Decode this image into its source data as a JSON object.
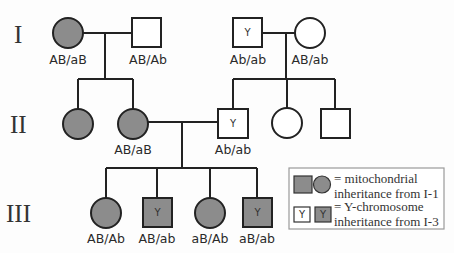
{
  "colors": {
    "affected_fill": "#8c8c8c",
    "unaffected_fill": "#ffffff",
    "stroke": "#222222",
    "legend_border": "#9a9a9a"
  },
  "generations": [
    {
      "label": "I"
    },
    {
      "label": "II"
    },
    {
      "label": "III"
    }
  ],
  "individuals": {
    "I_1": {
      "sex": "female",
      "shaded": true,
      "y_marker": false,
      "genotype": "AB/aB"
    },
    "I_2": {
      "sex": "male",
      "shaded": false,
      "y_marker": false,
      "genotype": "AB/Ab"
    },
    "I_3": {
      "sex": "male",
      "shaded": false,
      "y_marker": true,
      "y_text": "Y",
      "genotype": "Ab/ab"
    },
    "I_4": {
      "sex": "female",
      "shaded": false,
      "y_marker": false,
      "genotype": "AB/ab"
    },
    "II_1": {
      "sex": "female",
      "shaded": true,
      "y_marker": false,
      "genotype": ""
    },
    "II_2": {
      "sex": "female",
      "shaded": true,
      "y_marker": false,
      "genotype": "AB/aB"
    },
    "II_3": {
      "sex": "male",
      "shaded": false,
      "y_marker": true,
      "y_text": "Y",
      "genotype": "Ab/ab"
    },
    "II_4": {
      "sex": "female",
      "shaded": false,
      "y_marker": false,
      "genotype": ""
    },
    "II_5": {
      "sex": "male",
      "shaded": false,
      "y_marker": false,
      "genotype": ""
    },
    "III_1": {
      "sex": "female",
      "shaded": true,
      "y_marker": false,
      "genotype": "AB/Ab"
    },
    "III_2": {
      "sex": "male",
      "shaded": true,
      "y_marker": true,
      "y_text": "Y",
      "genotype": "AB/ab"
    },
    "III_3": {
      "sex": "female",
      "shaded": true,
      "y_marker": false,
      "genotype": "aB/Ab"
    },
    "III_4": {
      "sex": "male",
      "shaded": true,
      "y_marker": true,
      "y_text": "Y",
      "genotype": "aB/ab"
    }
  },
  "legend": {
    "mito_line1": "= mitochondrial",
    "mito_line2": "inheritance from I-1",
    "y_line1": "= Y-chromosome",
    "y_line2": "inheritance from I-3",
    "y_symbol_text": "Y"
  }
}
